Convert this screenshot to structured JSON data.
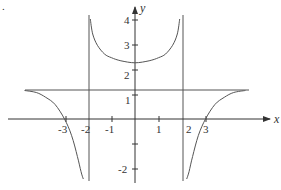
{
  "chart_data": {
    "type": "line",
    "title": "",
    "xlabel": "x",
    "ylabel": "y",
    "function_description": "rational function with vertical asymptotes x = -2 and x = 2, horizontal asymptote y ≈ 1.2, x-intercepts at -3 and 3, local minimum ≈ 2.25 at x = 0",
    "x_ticks": [
      "-3",
      "-2",
      "-1",
      "1",
      "2",
      "3"
    ],
    "y_ticks": [
      "4",
      "3",
      "2",
      "1",
      "-2"
    ],
    "xlim": [
      -5.3,
      5.9
    ],
    "ylim": [
      -2.5,
      4.5
    ],
    "grid": false,
    "asymptotes": {
      "vertical": [
        -2,
        2
      ],
      "horizontal": [
        1.2
      ]
    },
    "intercepts": {
      "x": [
        -3,
        3
      ],
      "y": 2.25
    },
    "series": [
      {
        "name": "left branch",
        "x": [
          -4.7,
          -4.2,
          -3.8,
          -3.4,
          -3.0,
          -2.7,
          -2.45,
          -2.3,
          -2.2
        ],
        "y": [
          1.14,
          1.06,
          0.87,
          0.58,
          0.0,
          -0.65,
          -1.5,
          -2.1,
          -2.4
        ]
      },
      {
        "name": "middle branch",
        "x": [
          -1.9,
          -1.8,
          -1.6,
          -1.3,
          -1.0,
          -0.6,
          0.0,
          0.6,
          1.0,
          1.3,
          1.6,
          1.8,
          1.9
        ],
        "y": [
          4.0,
          3.4,
          2.95,
          2.6,
          2.45,
          2.33,
          2.25,
          2.33,
          2.45,
          2.6,
          2.95,
          3.4,
          4.0
        ]
      },
      {
        "name": "right branch",
        "x": [
          2.2,
          2.3,
          2.45,
          2.7,
          3.0,
          3.4,
          3.8,
          4.2,
          4.7
        ],
        "y": [
          -2.4,
          -2.1,
          -1.5,
          -0.65,
          0.0,
          0.58,
          0.87,
          1.06,
          1.14
        ]
      }
    ]
  },
  "labels": {
    "corner_mark": "."
  }
}
